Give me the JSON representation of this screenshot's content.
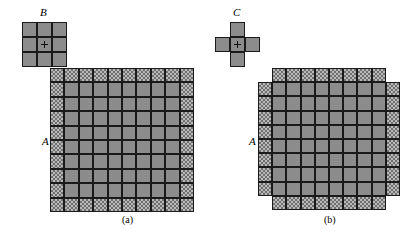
{
  "figure": {
    "width": 402,
    "height": 235,
    "background": "#ffffff",
    "colors": {
      "solid_fill": "#8c8c8c",
      "hatch_fill": "#b9b9b9",
      "hatch_pattern": "#6f6f6f",
      "cell_border": "#1a1a1a",
      "text": "#000000"
    }
  },
  "structuring_elements": [
    {
      "id": "B",
      "label": "B",
      "shape": "square-3x3",
      "rows": 3,
      "cols": 3,
      "cell_size": 15,
      "origin_x": 22,
      "origin_y": 22,
      "label_x": 40,
      "label_y": 7,
      "center_mark": true,
      "mask": [
        [
          1,
          1,
          1
        ],
        [
          1,
          1,
          1
        ],
        [
          1,
          1,
          1
        ]
      ]
    },
    {
      "id": "C",
      "label": "C",
      "shape": "cross-plus",
      "rows": 3,
      "cols": 3,
      "cell_size": 15,
      "origin_x": 215,
      "origin_y": 22,
      "label_x": 233,
      "label_y": 7,
      "center_mark": true,
      "mask": [
        [
          0,
          1,
          0
        ],
        [
          1,
          1,
          1
        ],
        [
          0,
          1,
          0
        ]
      ]
    }
  ],
  "panels": [
    {
      "id": "panel-a",
      "caption": "(a)",
      "caption_x": 122,
      "caption_y": 215,
      "object_label": "A",
      "object_label_x": 42,
      "object_label_y": 136,
      "origin_x": 50,
      "origin_y": 68,
      "rows": 10,
      "cols": 10,
      "cell_size": 14.4,
      "description": "10 by 10 square grid; border ring of cells is cross-hatched, inner 8 by 8 block is solid gray",
      "corners_removed": false,
      "mask": [
        [
          1,
          1,
          1,
          1,
          1,
          1,
          1,
          1,
          1,
          1
        ],
        [
          1,
          1,
          1,
          1,
          1,
          1,
          1,
          1,
          1,
          1
        ],
        [
          1,
          1,
          1,
          1,
          1,
          1,
          1,
          1,
          1,
          1
        ],
        [
          1,
          1,
          1,
          1,
          1,
          1,
          1,
          1,
          1,
          1
        ],
        [
          1,
          1,
          1,
          1,
          1,
          1,
          1,
          1,
          1,
          1
        ],
        [
          1,
          1,
          1,
          1,
          1,
          1,
          1,
          1,
          1,
          1
        ],
        [
          1,
          1,
          1,
          1,
          1,
          1,
          1,
          1,
          1,
          1
        ],
        [
          1,
          1,
          1,
          1,
          1,
          1,
          1,
          1,
          1,
          1
        ],
        [
          1,
          1,
          1,
          1,
          1,
          1,
          1,
          1,
          1,
          1
        ],
        [
          1,
          1,
          1,
          1,
          1,
          1,
          1,
          1,
          1,
          1
        ]
      ],
      "hatch": [
        [
          1,
          1,
          1,
          1,
          1,
          1,
          1,
          1,
          1,
          1
        ],
        [
          1,
          0,
          0,
          0,
          0,
          0,
          0,
          0,
          0,
          1
        ],
        [
          1,
          0,
          0,
          0,
          0,
          0,
          0,
          0,
          0,
          1
        ],
        [
          1,
          0,
          0,
          0,
          0,
          0,
          0,
          0,
          0,
          1
        ],
        [
          1,
          0,
          0,
          0,
          0,
          0,
          0,
          0,
          0,
          1
        ],
        [
          1,
          0,
          0,
          0,
          0,
          0,
          0,
          0,
          0,
          1
        ],
        [
          1,
          0,
          0,
          0,
          0,
          0,
          0,
          0,
          0,
          1
        ],
        [
          1,
          0,
          0,
          0,
          0,
          0,
          0,
          0,
          0,
          1
        ],
        [
          1,
          0,
          0,
          0,
          0,
          0,
          0,
          0,
          0,
          1
        ],
        [
          1,
          1,
          1,
          1,
          1,
          1,
          1,
          1,
          1,
          1
        ]
      ]
    },
    {
      "id": "panel-b",
      "caption": "(b)",
      "caption_x": 324,
      "caption_y": 215,
      "object_label": "A",
      "object_label_x": 249,
      "object_label_y": 136,
      "origin_x": 258,
      "origin_y": 68,
      "rows": 10,
      "cols": 10,
      "cell_size": 14.2,
      "description": "Same 10 by 10 grid with the four corner cells removed, giving an octagonal outline; border ring cross-hatched, interior solid gray",
      "corners_removed": true,
      "mask": [
        [
          0,
          1,
          1,
          1,
          1,
          1,
          1,
          1,
          1,
          0
        ],
        [
          1,
          1,
          1,
          1,
          1,
          1,
          1,
          1,
          1,
          1
        ],
        [
          1,
          1,
          1,
          1,
          1,
          1,
          1,
          1,
          1,
          1
        ],
        [
          1,
          1,
          1,
          1,
          1,
          1,
          1,
          1,
          1,
          1
        ],
        [
          1,
          1,
          1,
          1,
          1,
          1,
          1,
          1,
          1,
          1
        ],
        [
          1,
          1,
          1,
          1,
          1,
          1,
          1,
          1,
          1,
          1
        ],
        [
          1,
          1,
          1,
          1,
          1,
          1,
          1,
          1,
          1,
          1
        ],
        [
          1,
          1,
          1,
          1,
          1,
          1,
          1,
          1,
          1,
          1
        ],
        [
          1,
          1,
          1,
          1,
          1,
          1,
          1,
          1,
          1,
          1
        ],
        [
          0,
          1,
          1,
          1,
          1,
          1,
          1,
          1,
          1,
          0
        ]
      ],
      "hatch": [
        [
          0,
          1,
          1,
          1,
          1,
          1,
          1,
          1,
          1,
          0
        ],
        [
          1,
          0,
          0,
          0,
          0,
          0,
          0,
          0,
          0,
          1
        ],
        [
          1,
          0,
          0,
          0,
          0,
          0,
          0,
          0,
          0,
          1
        ],
        [
          1,
          0,
          0,
          0,
          0,
          0,
          0,
          0,
          0,
          1
        ],
        [
          1,
          0,
          0,
          0,
          0,
          0,
          0,
          0,
          0,
          1
        ],
        [
          1,
          0,
          0,
          0,
          0,
          0,
          0,
          0,
          0,
          1
        ],
        [
          1,
          0,
          0,
          0,
          0,
          0,
          0,
          0,
          0,
          1
        ],
        [
          1,
          0,
          0,
          0,
          0,
          0,
          0,
          0,
          0,
          1
        ],
        [
          1,
          0,
          0,
          0,
          0,
          0,
          0,
          0,
          0,
          1
        ],
        [
          0,
          1,
          1,
          1,
          1,
          1,
          1,
          1,
          1,
          0
        ]
      ]
    }
  ]
}
